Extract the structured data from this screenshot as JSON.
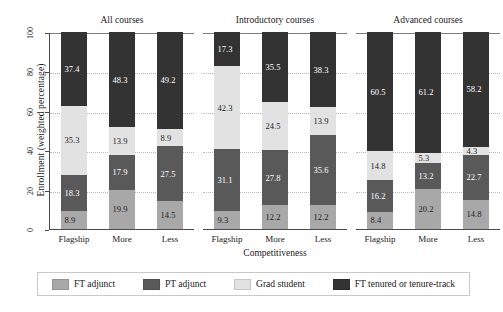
{
  "chart_data": {
    "type": "bar",
    "subtype": "stacked-bar-100",
    "title": "",
    "xlabel": "Competitiveness",
    "ylabel": "Enrollment (weighted percentage)",
    "ylim": [
      0,
      100
    ],
    "yticks": [
      0,
      20,
      40,
      60,
      80,
      100
    ],
    "grid": true,
    "legend_position": "bottom",
    "categories": [
      "Flagship",
      "More",
      "Less"
    ],
    "panels": [
      {
        "title": "All courses",
        "bars": [
          {
            "category": "Flagship",
            "values": [
              8.9,
              18.3,
              35.3,
              37.4
            ]
          },
          {
            "category": "More",
            "values": [
              19.9,
              17.9,
              13.9,
              48.3
            ]
          },
          {
            "category": "Less",
            "values": [
              14.5,
              27.5,
              8.9,
              49.2
            ]
          }
        ]
      },
      {
        "title": "Introductory courses",
        "bars": [
          {
            "category": "Flagship",
            "values": [
              9.3,
              31.1,
              42.3,
              17.3
            ]
          },
          {
            "category": "More",
            "values": [
              12.2,
              27.8,
              24.5,
              35.5
            ]
          },
          {
            "category": "Less",
            "values": [
              12.2,
              35.6,
              13.9,
              38.3
            ]
          }
        ]
      },
      {
        "title": "Advanced courses",
        "bars": [
          {
            "category": "Flagship",
            "values": [
              8.4,
              16.2,
              14.8,
              60.5
            ]
          },
          {
            "category": "More",
            "values": [
              20.2,
              13.2,
              5.3,
              61.2
            ]
          },
          {
            "category": "Less",
            "values": [
              14.8,
              22.7,
              4.3,
              58.2
            ]
          }
        ]
      }
    ],
    "series": [
      {
        "name": "FT adjunct",
        "color": "#a8a8a8",
        "label_color": "#1e1e1e"
      },
      {
        "name": "PT adjunct",
        "color": "#595959",
        "label_color": "#ffffff"
      },
      {
        "name": "Grad student",
        "color": "#e2e2e2",
        "label_color": "#1e1e1e"
      },
      {
        "name": "FT tenured or tenure-track",
        "color": "#333333",
        "label_color": "#ffffff"
      }
    ]
  },
  "legend": {
    "items": [
      {
        "label": "FT adjunct"
      },
      {
        "label": "PT adjunct"
      },
      {
        "label": "Grad student"
      },
      {
        "label": "FT tenured or tenure-track"
      }
    ]
  }
}
